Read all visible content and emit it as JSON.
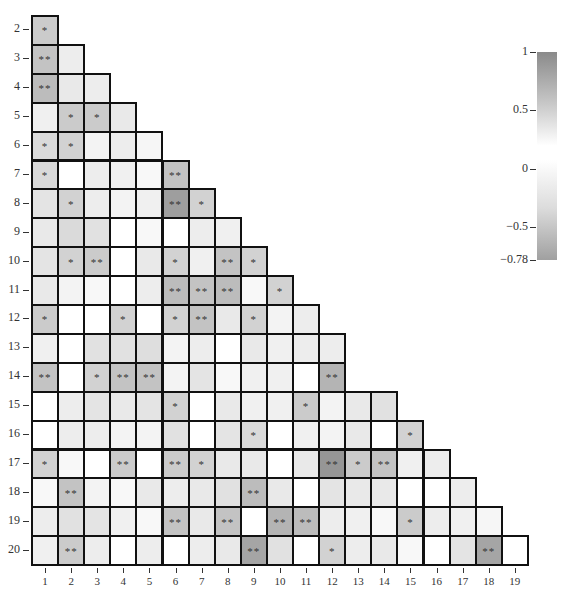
{
  "chart_data": {
    "type": "heatmap",
    "title": "",
    "subtitle": "",
    "layout": "lower-triangular correlation matrix",
    "x_labels": [
      "1",
      "2",
      "3",
      "4",
      "5",
      "6",
      "7",
      "8",
      "9",
      "10",
      "11",
      "12",
      "13",
      "14",
      "15",
      "16",
      "17",
      "18",
      "19"
    ],
    "y_labels": [
      "2",
      "3",
      "4",
      "5",
      "6",
      "7",
      "8",
      "9",
      "10",
      "11",
      "12",
      "13",
      "14",
      "15",
      "16",
      "17",
      "18",
      "19",
      "20"
    ],
    "colorbar": {
      "min": -0.78,
      "max": 1,
      "ticks": [
        1,
        0.5,
        0,
        -0.5,
        -0.78
      ],
      "tick_labels": [
        "1",
        "0.5",
        "0",
        "−0.5",
        "−0.78"
      ],
      "position": "right"
    },
    "significance_legend": {
      "*": "p<0.05",
      "**": "p<0.01"
    },
    "cells": [
      [
        {
          "v": 0.35,
          "s": "*"
        }
      ],
      [
        {
          "v": 0.4,
          "s": "**"
        },
        {
          "v": 0.12,
          "s": ""
        }
      ],
      [
        {
          "v": 0.45,
          "s": "**"
        },
        {
          "v": 0.15,
          "s": ""
        },
        {
          "v": 0.12,
          "s": ""
        }
      ],
      [
        {
          "v": 0.1,
          "s": ""
        },
        {
          "v": 0.35,
          "s": "*"
        },
        {
          "v": 0.35,
          "s": "*"
        },
        {
          "v": 0.15,
          "s": ""
        }
      ],
      [
        {
          "v": 0.25,
          "s": "*"
        },
        {
          "v": 0.3,
          "s": "*"
        },
        {
          "v": 0.08,
          "s": ""
        },
        {
          "v": 0.12,
          "s": ""
        },
        {
          "v": 0.06,
          "s": ""
        }
      ],
      [
        {
          "v": 0.25,
          "s": "*"
        },
        {
          "v": 0.0,
          "s": ""
        },
        {
          "v": 0.12,
          "s": ""
        },
        {
          "v": 0.1,
          "s": ""
        },
        {
          "v": 0.05,
          "s": ""
        },
        {
          "v": 0.4,
          "s": "**"
        }
      ],
      [
        {
          "v": 0.18,
          "s": ""
        },
        {
          "v": 0.3,
          "s": "*"
        },
        {
          "v": 0.12,
          "s": ""
        },
        {
          "v": 0.08,
          "s": ""
        },
        {
          "v": 0.1,
          "s": ""
        },
        {
          "v": 0.65,
          "s": "**"
        },
        {
          "v": 0.3,
          "s": "*"
        }
      ],
      [
        {
          "v": 0.15,
          "s": ""
        },
        {
          "v": 0.25,
          "s": ""
        },
        {
          "v": 0.2,
          "s": ""
        },
        {
          "v": 0.0,
          "s": ""
        },
        {
          "v": 0.05,
          "s": ""
        },
        {
          "v": 0.0,
          "s": ""
        },
        {
          "v": 0.12,
          "s": ""
        },
        {
          "v": 0.1,
          "s": ""
        }
      ],
      [
        {
          "v": 0.18,
          "s": ""
        },
        {
          "v": 0.3,
          "s": "*"
        },
        {
          "v": 0.35,
          "s": "**"
        },
        {
          "v": 0.0,
          "s": ""
        },
        {
          "v": 0.15,
          "s": ""
        },
        {
          "v": 0.3,
          "s": "*"
        },
        {
          "v": 0.1,
          "s": ""
        },
        {
          "v": 0.4,
          "s": "**"
        },
        {
          "v": 0.3,
          "s": "*"
        }
      ],
      [
        {
          "v": 0.15,
          "s": ""
        },
        {
          "v": 0.08,
          "s": ""
        },
        {
          "v": 0.05,
          "s": ""
        },
        {
          "v": 0.0,
          "s": ""
        },
        {
          "v": 0.12,
          "s": ""
        },
        {
          "v": 0.45,
          "s": "**"
        },
        {
          "v": 0.4,
          "s": "**"
        },
        {
          "v": 0.45,
          "s": "**"
        },
        {
          "v": 0.05,
          "s": ""
        },
        {
          "v": 0.3,
          "s": "*"
        }
      ],
      [
        {
          "v": 0.35,
          "s": "*"
        },
        {
          "v": 0.0,
          "s": ""
        },
        {
          "v": 0.0,
          "s": ""
        },
        {
          "v": 0.3,
          "s": "*"
        },
        {
          "v": 0.0,
          "s": ""
        },
        {
          "v": 0.3,
          "s": "*"
        },
        {
          "v": 0.4,
          "s": "**"
        },
        {
          "v": 0.15,
          "s": ""
        },
        {
          "v": 0.3,
          "s": "*"
        },
        {
          "v": 0.08,
          "s": ""
        },
        {
          "v": 0.12,
          "s": ""
        }
      ],
      [
        {
          "v": 0.1,
          "s": ""
        },
        {
          "v": 0.0,
          "s": ""
        },
        {
          "v": 0.2,
          "s": ""
        },
        {
          "v": 0.2,
          "s": ""
        },
        {
          "v": 0.22,
          "s": ""
        },
        {
          "v": 0.08,
          "s": ""
        },
        {
          "v": 0.12,
          "s": ""
        },
        {
          "v": 0.0,
          "s": ""
        },
        {
          "v": 0.15,
          "s": ""
        },
        {
          "v": 0.1,
          "s": ""
        },
        {
          "v": 0.12,
          "s": ""
        },
        {
          "v": 0.12,
          "s": ""
        }
      ],
      [
        {
          "v": 0.4,
          "s": "**"
        },
        {
          "v": 0.0,
          "s": ""
        },
        {
          "v": 0.3,
          "s": "*"
        },
        {
          "v": 0.4,
          "s": "**"
        },
        {
          "v": 0.4,
          "s": "**"
        },
        {
          "v": 0.08,
          "s": ""
        },
        {
          "v": 0.18,
          "s": ""
        },
        {
          "v": 0.05,
          "s": ""
        },
        {
          "v": 0.1,
          "s": ""
        },
        {
          "v": 0.1,
          "s": ""
        },
        {
          "v": 0.0,
          "s": ""
        },
        {
          "v": 0.5,
          "s": "**"
        }
      ],
      [
        {
          "v": 0.0,
          "s": ""
        },
        {
          "v": 0.12,
          "s": ""
        },
        {
          "v": 0.18,
          "s": ""
        },
        {
          "v": 0.15,
          "s": ""
        },
        {
          "v": 0.18,
          "s": ""
        },
        {
          "v": 0.3,
          "s": "*"
        },
        {
          "v": 0.0,
          "s": ""
        },
        {
          "v": 0.15,
          "s": ""
        },
        {
          "v": 0.1,
          "s": ""
        },
        {
          "v": 0.1,
          "s": ""
        },
        {
          "v": 0.35,
          "s": "*"
        },
        {
          "v": 0.08,
          "s": ""
        },
        {
          "v": 0.15,
          "s": ""
        },
        {
          "v": 0.2,
          "s": ""
        }
      ],
      [
        {
          "v": 0.0,
          "s": ""
        },
        {
          "v": 0.12,
          "s": ""
        },
        {
          "v": 0.12,
          "s": ""
        },
        {
          "v": 0.08,
          "s": ""
        },
        {
          "v": 0.08,
          "s": ""
        },
        {
          "v": 0.2,
          "s": ""
        },
        {
          "v": 0.0,
          "s": ""
        },
        {
          "v": 0.18,
          "s": ""
        },
        {
          "v": 0.25,
          "s": "*"
        },
        {
          "v": 0.0,
          "s": ""
        },
        {
          "v": 0.1,
          "s": ""
        },
        {
          "v": 0.08,
          "s": ""
        },
        {
          "v": 0.15,
          "s": ""
        },
        {
          "v": 0.0,
          "s": ""
        },
        {
          "v": 0.3,
          "s": "*"
        }
      ],
      [
        {
          "v": 0.3,
          "s": "*"
        },
        {
          "v": 0.05,
          "s": ""
        },
        {
          "v": 0.0,
          "s": ""
        },
        {
          "v": 0.35,
          "s": "**"
        },
        {
          "v": 0.0,
          "s": ""
        },
        {
          "v": 0.35,
          "s": "**"
        },
        {
          "v": 0.3,
          "s": "*"
        },
        {
          "v": 0.15,
          "s": ""
        },
        {
          "v": 0.15,
          "s": ""
        },
        {
          "v": 0.0,
          "s": ""
        },
        {
          "v": 0.15,
          "s": ""
        },
        {
          "v": 0.7,
          "s": "**"
        },
        {
          "v": 0.35,
          "s": "*"
        },
        {
          "v": 0.4,
          "s": "**"
        },
        {
          "v": 0.1,
          "s": ""
        },
        {
          "v": 0.12,
          "s": ""
        }
      ],
      [
        {
          "v": 0.05,
          "s": ""
        },
        {
          "v": 0.4,
          "s": "**"
        },
        {
          "v": 0.08,
          "s": ""
        },
        {
          "v": 0.05,
          "s": ""
        },
        {
          "v": 0.15,
          "s": ""
        },
        {
          "v": 0.12,
          "s": ""
        },
        {
          "v": 0.15,
          "s": ""
        },
        {
          "v": 0.2,
          "s": ""
        },
        {
          "v": 0.45,
          "s": "**"
        },
        {
          "v": 0.15,
          "s": ""
        },
        {
          "v": 0.0,
          "s": ""
        },
        {
          "v": 0.18,
          "s": ""
        },
        {
          "v": 0.15,
          "s": ""
        },
        {
          "v": 0.15,
          "s": ""
        },
        {
          "v": 0.0,
          "s": ""
        },
        {
          "v": 0.0,
          "s": ""
        },
        {
          "v": 0.12,
          "s": ""
        }
      ],
      [
        {
          "v": 0.12,
          "s": ""
        },
        {
          "v": 0.2,
          "s": ""
        },
        {
          "v": 0.18,
          "s": ""
        },
        {
          "v": 0.1,
          "s": ""
        },
        {
          "v": 0.05,
          "s": ""
        },
        {
          "v": 0.4,
          "s": "**"
        },
        {
          "v": 0.15,
          "s": ""
        },
        {
          "v": 0.4,
          "s": "**"
        },
        {
          "v": 0.0,
          "s": ""
        },
        {
          "v": 0.5,
          "s": "**"
        },
        {
          "v": 0.45,
          "s": "**"
        },
        {
          "v": 0.12,
          "s": ""
        },
        {
          "v": 0.1,
          "s": ""
        },
        {
          "v": 0.05,
          "s": ""
        },
        {
          "v": 0.35,
          "s": "*"
        },
        {
          "v": 0.12,
          "s": ""
        },
        {
          "v": 0.1,
          "s": ""
        },
        {
          "v": 0.06,
          "s": ""
        }
      ],
      [
        {
          "v": 0.1,
          "s": ""
        },
        {
          "v": 0.35,
          "s": "**"
        },
        {
          "v": 0.12,
          "s": ""
        },
        {
          "v": 0.0,
          "s": ""
        },
        {
          "v": 0.12,
          "s": ""
        },
        {
          "v": 0.0,
          "s": ""
        },
        {
          "v": 0.12,
          "s": ""
        },
        {
          "v": 0.15,
          "s": ""
        },
        {
          "v": 0.6,
          "s": "**"
        },
        {
          "v": 0.2,
          "s": ""
        },
        {
          "v": 0.0,
          "s": ""
        },
        {
          "v": 0.3,
          "s": "*"
        },
        {
          "v": 0.12,
          "s": ""
        },
        {
          "v": 0.15,
          "s": ""
        },
        {
          "v": 0.05,
          "s": ""
        },
        {
          "v": 0.0,
          "s": ""
        },
        {
          "v": 0.18,
          "s": ""
        },
        {
          "v": 0.6,
          "s": "**"
        },
        {
          "v": 0.0,
          "s": ""
        }
      ]
    ],
    "note": "Cell 'v' values are estimated grayscale intensities read from the figure (magnitude, 0 = white, 1 = darkest); 's' is the significance marker shown in the cell."
  }
}
